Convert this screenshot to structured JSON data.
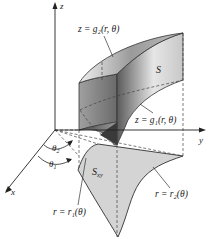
{
  "axes": {
    "x_label": "x",
    "y_label": "y",
    "z_label": "z"
  },
  "labels": {
    "upper_surface": "z = g₂(r, θ)",
    "lower_surface": "z = g₁(r, θ)",
    "solid": "S",
    "region": "S",
    "region_sub": "xy",
    "theta2": "θ",
    "theta2_sub": "2",
    "theta1": "θ",
    "theta1_sub": "1",
    "inner_curve": "r = r₁(θ)",
    "outer_curve": "r = r₂(θ)"
  },
  "colors": {
    "region_fill": "#d4d4d4",
    "solid_dark": "#6e6e6e",
    "solid_light": "#e8e8e8",
    "line": "#333333"
  }
}
